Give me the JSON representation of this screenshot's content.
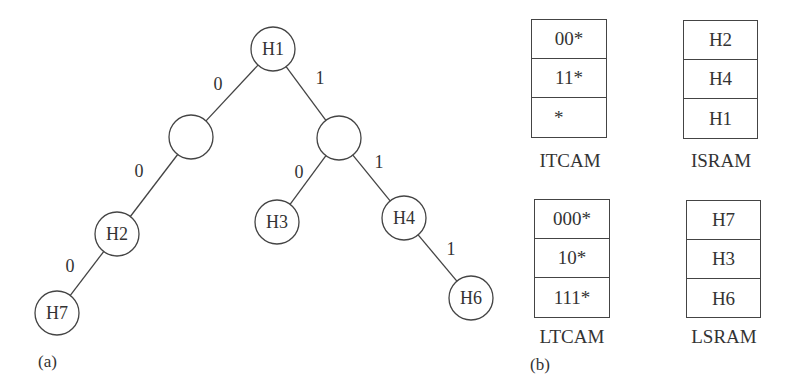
{
  "panel_a": {
    "label": "(a)",
    "nodes": [
      {
        "id": "H1",
        "label": "H1",
        "x": 273,
        "y": 49
      },
      {
        "id": "L",
        "label": "",
        "x": 191,
        "y": 137
      },
      {
        "id": "R",
        "label": "",
        "x": 339,
        "y": 138
      },
      {
        "id": "H2",
        "label": "H2",
        "x": 117,
        "y": 234
      },
      {
        "id": "H3",
        "label": "H3",
        "x": 277,
        "y": 222
      },
      {
        "id": "H4",
        "label": "H4",
        "x": 404,
        "y": 218
      },
      {
        "id": "H7",
        "label": "H7",
        "x": 57,
        "y": 313
      },
      {
        "id": "H6",
        "label": "H6",
        "x": 471,
        "y": 298
      }
    ],
    "edges": [
      {
        "from": "H1",
        "to": "L",
        "label": "0",
        "lx": 218,
        "ly": 90
      },
      {
        "from": "H1",
        "to": "R",
        "label": "1",
        "lx": 320,
        "ly": 84
      },
      {
        "from": "L",
        "to": "H2",
        "label": "0",
        "lx": 139,
        "ly": 177
      },
      {
        "from": "R",
        "to": "H3",
        "label": "0",
        "lx": 299,
        "ly": 178
      },
      {
        "from": "R",
        "to": "H4",
        "label": "1",
        "lx": 379,
        "ly": 168
      },
      {
        "from": "H2",
        "to": "H7",
        "label": "0",
        "lx": 70,
        "ly": 272
      },
      {
        "from": "H4",
        "to": "H6",
        "label": "1",
        "lx": 451,
        "ly": 255
      }
    ],
    "node_radius": 22
  },
  "panel_b": {
    "label": "(b)",
    "itcam": {
      "caption": "ITCAM",
      "entries": [
        "00*",
        "11*",
        "*"
      ]
    },
    "isram": {
      "caption": "ISRAM",
      "entries": [
        "H2",
        "H4",
        "H1"
      ]
    },
    "ltcam": {
      "caption": "LTCAM",
      "entries": [
        "000*",
        "10*",
        "111*"
      ]
    },
    "lsram": {
      "caption": "LSRAM",
      "entries": [
        "H7",
        "H3",
        "H6"
      ]
    }
  }
}
